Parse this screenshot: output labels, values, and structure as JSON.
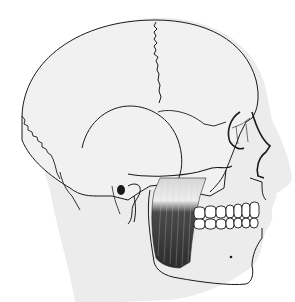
{
  "image": {
    "subject": "Lateral view of human head with skull and masseter muscle",
    "colors": {
      "background": "#ffffff",
      "head_silhouette": "#ececec",
      "skull_fill": "#f1f1f1",
      "line": "#1a1a1a",
      "muscle_dark": "#3a3a3a",
      "muscle_tendon": "#d8d8d8",
      "teeth": "#ffffff"
    }
  }
}
